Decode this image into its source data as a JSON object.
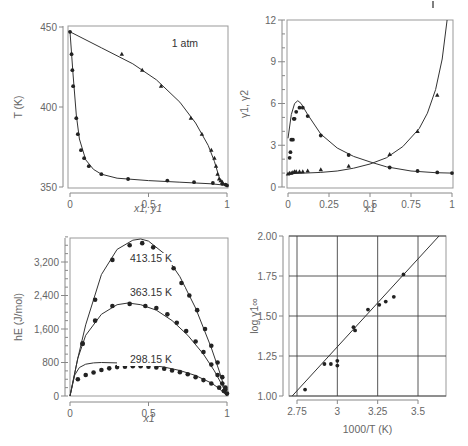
{
  "chart_data": [
    {
      "id": "txy",
      "type": "scatter",
      "title": "",
      "annotation": "1 atm",
      "xlabel": "x1, y1",
      "ylabel": "T (K)",
      "xlim": [
        0,
        1
      ],
      "ylim": [
        350,
        450
      ],
      "xticks": [
        "0",
        "0.5",
        "1"
      ],
      "yticks": [
        "350",
        "400",
        "450"
      ],
      "series": [
        {
          "name": "liquid (x1) data",
          "marker": "circle",
          "x": [
            0.0,
            0.01,
            0.015,
            0.02,
            0.04,
            0.05,
            0.07,
            0.09,
            0.12,
            0.2,
            0.37,
            0.62,
            0.79,
            0.91,
            0.97,
            0.99,
            1.0
          ],
          "y": [
            447,
            433,
            423,
            413,
            393,
            383,
            373,
            368,
            363,
            358,
            355,
            354,
            353,
            352.5,
            352,
            351.5,
            351
          ]
        },
        {
          "name": "vapor (y1) data",
          "marker": "triangle",
          "x": [
            0.33,
            0.46,
            0.58,
            0.77,
            0.84,
            0.9,
            0.92,
            0.93,
            0.94,
            0.95,
            0.96,
            0.97
          ],
          "y": [
            433,
            423,
            413,
            393,
            383,
            373,
            368,
            363,
            358,
            355,
            354,
            353
          ]
        },
        {
          "name": "liquid curve",
          "marker": "line",
          "x": [
            0,
            0.02,
            0.04,
            0.06,
            0.1,
            0.15,
            0.2,
            0.3,
            0.5,
            0.7,
            0.9,
            1.0
          ],
          "y": [
            447,
            420,
            395,
            380,
            367,
            361,
            358,
            355.5,
            354,
            353,
            352,
            351
          ]
        },
        {
          "name": "vapor curve",
          "marker": "line",
          "x": [
            0,
            0.2,
            0.4,
            0.55,
            0.7,
            0.8,
            0.88,
            0.92,
            0.95,
            0.97,
            1.0
          ],
          "y": [
            447,
            437,
            427,
            417,
            403,
            390,
            376,
            366,
            356,
            352,
            351
          ]
        }
      ]
    },
    {
      "id": "gamma",
      "type": "scatter",
      "title": "",
      "xlabel": "x1",
      "ylabel": "γ1, γ2",
      "xlim": [
        0,
        1
      ],
      "ylim": [
        0,
        12
      ],
      "xticks": [
        "0",
        "0.25",
        "0.5",
        "0.75",
        "1"
      ],
      "yticks": [
        "0",
        "3",
        "6",
        "9",
        "12"
      ],
      "series": [
        {
          "name": "γ1 data",
          "marker": "circle",
          "x": [
            0.01,
            0.015,
            0.02,
            0.03,
            0.035,
            0.04,
            0.05,
            0.07,
            0.09,
            0.12,
            0.2,
            0.37,
            0.62,
            0.79,
            0.91,
            1.0
          ],
          "y": [
            2.1,
            2.5,
            3.4,
            3.4,
            4.9,
            4.9,
            5.4,
            5.7,
            5.7,
            5.1,
            3.7,
            2.3,
            1.4,
            1.15,
            1.05,
            1.0
          ]
        },
        {
          "name": "γ2 data",
          "marker": "triangle",
          "x": [
            0.0,
            0.01,
            0.02,
            0.03,
            0.04,
            0.05,
            0.07,
            0.09,
            0.12,
            0.2,
            0.37,
            0.62,
            0.79,
            0.91
          ],
          "y": [
            0.95,
            1.0,
            1.0,
            1.05,
            1.1,
            1.1,
            1.1,
            1.1,
            1.15,
            1.25,
            1.5,
            2.35,
            4.0,
            6.6
          ]
        },
        {
          "name": "γ1 curve",
          "marker": "line",
          "x": [
            0.0,
            0.02,
            0.04,
            0.06,
            0.08,
            0.12,
            0.2,
            0.3,
            0.4,
            0.5,
            0.6,
            0.75,
            0.9,
            1.0
          ],
          "y": [
            3.5,
            5.2,
            6.0,
            6.2,
            6.0,
            5.2,
            3.8,
            2.8,
            2.2,
            1.8,
            1.45,
            1.15,
            1.03,
            1.0
          ]
        },
        {
          "name": "γ2 curve",
          "marker": "line",
          "x": [
            0.0,
            0.1,
            0.2,
            0.3,
            0.4,
            0.5,
            0.6,
            0.7,
            0.8,
            0.85,
            0.9,
            0.94,
            0.97
          ],
          "y": [
            0.95,
            1.0,
            1.05,
            1.15,
            1.35,
            1.65,
            2.1,
            2.9,
            4.2,
            5.3,
            7.0,
            9.2,
            12.0
          ]
        }
      ]
    },
    {
      "id": "hE",
      "type": "scatter",
      "title": "",
      "xlabel": "x1",
      "ylabel": "hE (J/mol)",
      "xlim": [
        0,
        1
      ],
      "ylim": [
        0,
        3800
      ],
      "xticks": [
        "0",
        "0.5",
        "1"
      ],
      "yticks": [
        "0",
        "800",
        "1,600",
        "2,400",
        "3,200"
      ],
      "annotations": [
        "413.15 K",
        "363.15 K",
        "298.15 K"
      ],
      "series": [
        {
          "name": "413.15 K data",
          "marker": "circle",
          "x": [
            0.08,
            0.16,
            0.27,
            0.38,
            0.46,
            0.53,
            0.6,
            0.66,
            0.71,
            0.76,
            0.81,
            0.86,
            0.9,
            0.94,
            0.97,
            0.99
          ],
          "y": [
            1250,
            2300,
            3250,
            3600,
            3650,
            3550,
            3350,
            3050,
            2700,
            2400,
            2050,
            1600,
            1200,
            800,
            450,
            200
          ]
        },
        {
          "name": "363.15 K data",
          "marker": "circle",
          "x": [
            0.08,
            0.16,
            0.27,
            0.38,
            0.48,
            0.55,
            0.62,
            0.68,
            0.74,
            0.8,
            0.85,
            0.9,
            0.94,
            0.97,
            0.99
          ],
          "y": [
            1250,
            1800,
            2150,
            2200,
            2150,
            2100,
            1950,
            1750,
            1550,
            1300,
            1050,
            750,
            500,
            300,
            150
          ]
        },
        {
          "name": "298.15 K data",
          "marker": "circle",
          "x": [
            0.05,
            0.1,
            0.15,
            0.2,
            0.25,
            0.3,
            0.35,
            0.4,
            0.45,
            0.5,
            0.55,
            0.6,
            0.65,
            0.7,
            0.75,
            0.8,
            0.85,
            0.9,
            0.95,
            0.98,
            1.0
          ],
          "y": [
            400,
            500,
            560,
            620,
            660,
            690,
            700,
            710,
            710,
            700,
            680,
            650,
            610,
            570,
            520,
            450,
            380,
            300,
            200,
            120,
            60
          ]
        },
        {
          "name": "413.15 K curve",
          "marker": "line",
          "x": [
            0,
            0.05,
            0.1,
            0.2,
            0.3,
            0.4,
            0.45,
            0.5,
            0.6,
            0.7,
            0.8,
            0.9,
            0.95,
            1.0
          ],
          "y": [
            0,
            900,
            1700,
            2900,
            3500,
            3720,
            3750,
            3700,
            3400,
            2850,
            2100,
            1150,
            600,
            0
          ]
        },
        {
          "name": "363.15 K curve",
          "marker": "line",
          "x": [
            0,
            0.05,
            0.1,
            0.2,
            0.3,
            0.37,
            0.45,
            0.55,
            0.65,
            0.75,
            0.85,
            0.92,
            0.97,
            1.0
          ],
          "y": [
            0,
            900,
            1450,
            1950,
            2180,
            2220,
            2180,
            2050,
            1800,
            1450,
            1000,
            600,
            250,
            0
          ]
        },
        {
          "name": "298.15 K curve",
          "marker": "line",
          "x": [
            0,
            0.03,
            0.06,
            0.1,
            0.15,
            0.2,
            0.3,
            0.4,
            0.5,
            0.6,
            0.7,
            0.8,
            0.9,
            0.95,
            1.0
          ],
          "y": [
            0,
            500,
            680,
            760,
            790,
            800,
            790,
            770,
            740,
            690,
            610,
            490,
            310,
            180,
            0
          ]
        }
      ]
    },
    {
      "id": "loggamma",
      "type": "scatter",
      "title": "",
      "xlabel": "1000/T (K)",
      "ylabel": "log γ1∞",
      "xlim": [
        2.7,
        3.65
      ],
      "ylim": [
        1.0,
        2.0
      ],
      "xticks": [
        "2.75",
        "3",
        "3.25",
        "3.5"
      ],
      "yticks": [
        "1.00",
        "1.25",
        "1.50",
        "1.75",
        "2.00"
      ],
      "grid": true,
      "series": [
        {
          "name": "data",
          "marker": "circle",
          "x": [
            2.8,
            2.92,
            2.96,
            3.0,
            3.0,
            3.1,
            3.11,
            3.19,
            3.26,
            3.3,
            3.35,
            3.41
          ],
          "y": [
            1.04,
            1.2,
            1.2,
            1.22,
            1.19,
            1.43,
            1.41,
            1.54,
            1.57,
            1.59,
            1.62,
            1.76
          ]
        },
        {
          "name": "fit line",
          "marker": "line",
          "x": [
            2.72,
            3.63
          ],
          "y": [
            1.0,
            2.0
          ]
        }
      ]
    }
  ]
}
